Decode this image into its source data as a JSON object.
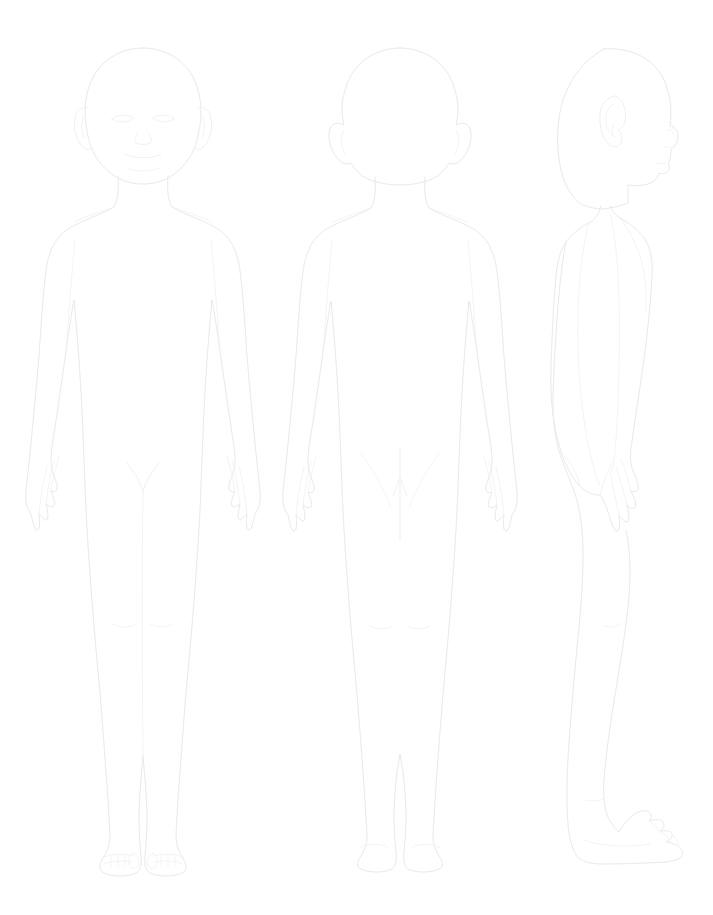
{
  "document": {
    "title": "Body Diagram",
    "kind": "clinical-body-outline-chart",
    "background_color": "#ffffff",
    "line_color": "#e9e9ee",
    "width": 713,
    "height": 915,
    "figure_count": 3
  },
  "chart_data": {
    "type": "diagram",
    "subtitle": "",
    "xlabel": "",
    "ylabel": "",
    "legend_position": "none",
    "grid": false,
    "categories": [
      "Anterior view",
      "Posterior view",
      "Lateral view"
    ],
    "series": [
      {
        "name": "Figure outlines",
        "values": [
          1,
          1,
          1
        ]
      }
    ],
    "annotations": [
      {
        "name": "gluteal-cleft-arrow",
        "figure": "Posterior view",
        "shape": "arrow-up",
        "x": 400,
        "y": 500
      }
    ]
  },
  "figures": [
    {
      "id": "anterior",
      "label": "Anterior view",
      "view": "front",
      "center_x": 143,
      "top_y": 48,
      "bottom_y": 878,
      "features": [
        "head",
        "face",
        "eyes",
        "nose",
        "mouth",
        "ears",
        "neck",
        "shoulders",
        "chest",
        "arms",
        "hands",
        "fingers",
        "torso",
        "groin",
        "legs",
        "knees",
        "feet",
        "toes"
      ]
    },
    {
      "id": "posterior",
      "label": "Posterior view",
      "view": "back",
      "center_x": 400,
      "top_y": 48,
      "bottom_y": 878,
      "features": [
        "head",
        "ears",
        "neck",
        "shoulders",
        "back",
        "arms",
        "hands",
        "fingers",
        "buttocks",
        "gluteal-cleft-arrow",
        "legs",
        "knees",
        "heels"
      ]
    },
    {
      "id": "lateral",
      "label": "Lateral view",
      "view": "side",
      "facing": "right",
      "center_x": 615,
      "top_y": 48,
      "bottom_y": 878,
      "features": [
        "head-profile",
        "ear",
        "nose",
        "lips",
        "chin",
        "neck",
        "shoulder",
        "chest",
        "abdomen",
        "back",
        "buttocks",
        "arm",
        "hand",
        "fingers",
        "thigh",
        "calf",
        "foot",
        "toes"
      ]
    }
  ],
  "captions": {
    "anterior": "",
    "posterior": "",
    "lateral": ""
  }
}
